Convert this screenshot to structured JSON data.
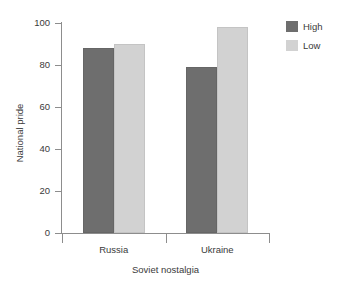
{
  "figure": {
    "background_color": "#ffffff",
    "width": 346,
    "height": 289
  },
  "legend": {
    "position": "top-right",
    "entries": [
      {
        "label": "High",
        "color": "#6e6e6e",
        "swatch_name": "legend-swatch-high"
      },
      {
        "label": "Low",
        "color": "#d2d2d2",
        "swatch_name": "legend-swatch-low"
      }
    ]
  },
  "axes": {
    "y": {
      "title": "National pride",
      "ticks": [
        "0",
        "20",
        "40",
        "60",
        "80",
        "100"
      ],
      "min": 0,
      "max": 100
    },
    "x": {
      "title": "Soviet nostalgia",
      "categories": [
        "Russia",
        "Ukraine"
      ]
    }
  },
  "chart_data": {
    "type": "bar",
    "title": "",
    "subtitle": "",
    "xlabel": "Soviet nostalgia",
    "ylabel": "National pride",
    "categories": [
      "Russia",
      "Ukraine"
    ],
    "series": [
      {
        "name": "High",
        "color": "#6e6e6e",
        "values": [
          88,
          79
        ]
      },
      {
        "name": "Low",
        "color": "#d2d2d2",
        "values": [
          90,
          98
        ]
      }
    ],
    "ylim": [
      0,
      100
    ],
    "ytick_step": 20,
    "grid": false,
    "legend_position": "top-right",
    "grouped": true,
    "annotations": []
  }
}
